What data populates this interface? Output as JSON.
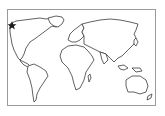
{
  "map": {
    "type": "world-outline",
    "marker": {
      "icon": "star-icon",
      "region": "Alaska / northwest North America",
      "color": "#1a1a1a"
    },
    "frame_color": "#9a9a9a",
    "outline_color": "#3a3a3a"
  }
}
